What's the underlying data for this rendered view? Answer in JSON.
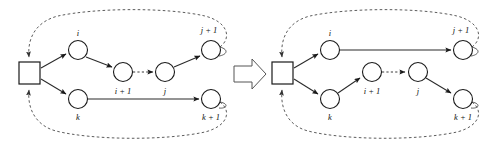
{
  "figure": {
    "panel_count": 2,
    "background_color": "#ffffff",
    "line_color": "#2a2a2a",
    "node_fill": "#ffffff"
  },
  "transition": {
    "icon": "right-arrow-block-icon",
    "direction": "left-to-right"
  },
  "labels": {
    "i": "i",
    "i_plus_1": "i + 1",
    "j": "j",
    "j_plus_1": "j + 1",
    "k": "k",
    "k_plus_1": "k + 1"
  },
  "left_panel": {
    "name": "before-configuration",
    "depot": {
      "label": "",
      "shape": "square",
      "x": 29,
      "y": 73
    },
    "nodes": [
      {
        "id": "i",
        "label": "i",
        "x": 78,
        "y": 50,
        "label_x": 78,
        "label_y": 34
      },
      {
        "id": "i_plus_1",
        "label": "i + 1",
        "x": 123,
        "y": 72,
        "label_x": 123,
        "label_y": 92
      },
      {
        "id": "j",
        "label": "j",
        "x": 165,
        "y": 72,
        "label_x": 165,
        "label_y": 92
      },
      {
        "id": "j_plus_1",
        "label": "j + 1",
        "x": 211,
        "y": 50,
        "label_x": 209,
        "label_y": 31
      },
      {
        "id": "k",
        "label": "k",
        "x": 78,
        "y": 99,
        "label_x": 78,
        "label_y": 118
      },
      {
        "id": "k_plus_1",
        "label": "k + 1",
        "x": 211,
        "y": 99,
        "label_x": 211,
        "label_y": 118
      }
    ],
    "edges": [
      {
        "from": "depot",
        "to": "i",
        "style": "solid",
        "arrow": true
      },
      {
        "from": "i",
        "to": "i_plus_1",
        "style": "solid",
        "arrow": true
      },
      {
        "from": "i_plus_1",
        "to": "j",
        "style": "dashed",
        "arrow": true
      },
      {
        "from": "j",
        "to": "j_plus_1",
        "style": "solid",
        "arrow": true
      },
      {
        "from": "depot",
        "to": "k",
        "style": "solid",
        "arrow": true
      },
      {
        "from": "k",
        "to": "k_plus_1",
        "style": "solid",
        "arrow": true
      },
      {
        "from": "j_plus_1",
        "to": "depot",
        "style": "dashed-loop",
        "arrow": true
      },
      {
        "from": "k_plus_1",
        "to": "depot",
        "style": "dashed-loop",
        "arrow": true
      }
    ]
  },
  "right_panel": {
    "name": "after-configuration",
    "depot": {
      "label": "",
      "shape": "square",
      "x": 282,
      "y": 73
    },
    "nodes": [
      {
        "id": "i",
        "label": "i",
        "x": 330,
        "y": 50,
        "label_x": 330,
        "label_y": 34
      },
      {
        "id": "i_plus_1",
        "label": "i + 1",
        "x": 372,
        "y": 72,
        "label_x": 372,
        "label_y": 92
      },
      {
        "id": "j",
        "label": "j",
        "x": 418,
        "y": 72,
        "label_x": 418,
        "label_y": 92
      },
      {
        "id": "j_plus_1",
        "label": "j + 1",
        "x": 463,
        "y": 50,
        "label_x": 461,
        "label_y": 31
      },
      {
        "id": "k",
        "label": "k",
        "x": 330,
        "y": 99,
        "label_x": 330,
        "label_y": 118
      },
      {
        "id": "k_plus_1",
        "label": "k + 1",
        "x": 463,
        "y": 99,
        "label_x": 463,
        "label_y": 118
      }
    ],
    "edges": [
      {
        "from": "depot",
        "to": "i",
        "style": "solid",
        "arrow": true
      },
      {
        "from": "i",
        "to": "j_plus_1",
        "style": "solid",
        "arrow": true
      },
      {
        "from": "depot",
        "to": "k",
        "style": "solid",
        "arrow": true
      },
      {
        "from": "k",
        "to": "i_plus_1",
        "style": "solid",
        "arrow": true
      },
      {
        "from": "i_plus_1",
        "to": "j",
        "style": "dashed",
        "arrow": true
      },
      {
        "from": "j",
        "to": "k_plus_1",
        "style": "solid",
        "arrow": true
      },
      {
        "from": "j_plus_1",
        "to": "depot",
        "style": "dashed-loop",
        "arrow": true
      },
      {
        "from": "k_plus_1",
        "to": "depot",
        "style": "dashed-loop",
        "arrow": true
      }
    ]
  }
}
